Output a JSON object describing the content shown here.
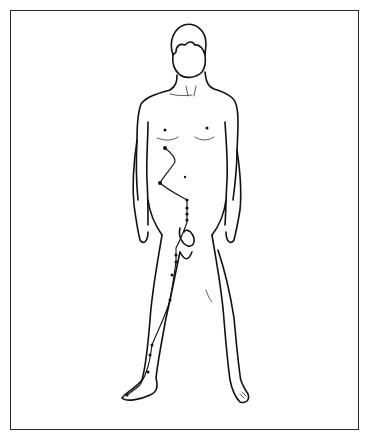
{
  "figure": {
    "style": "line-art",
    "stroke_color": "#111111",
    "background_color": "#ffffff",
    "frame_color": "#2a2a2a"
  },
  "meridian": {
    "name": "meridian-path",
    "side": "right-leg-and-abdomen",
    "points": [
      {
        "x": 165,
        "y": 148
      },
      {
        "x": 175,
        "y": 162
      },
      {
        "x": 160,
        "y": 183
      },
      {
        "x": 187,
        "y": 200
      },
      {
        "x": 187,
        "y": 208
      },
      {
        "x": 187,
        "y": 214
      },
      {
        "x": 187,
        "y": 220
      },
      {
        "x": 176,
        "y": 248
      },
      {
        "x": 176,
        "y": 260
      },
      {
        "x": 172,
        "y": 275
      },
      {
        "x": 170,
        "y": 300
      },
      {
        "x": 168,
        "y": 305
      },
      {
        "x": 152,
        "y: ": 345
      },
      {
        "x": 150,
        "y": 355
      },
      {
        "x": 148,
        "y": 372
      },
      {
        "x": 140,
        "y": 385
      },
      {
        "x": 127,
        "y": 395
      }
    ]
  }
}
